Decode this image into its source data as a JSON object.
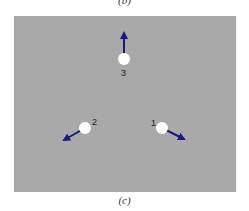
{
  "captions": {
    "top": "(b)",
    "bottom": "(c)"
  },
  "diagram": {
    "background_color": "#a9a9a9",
    "dot_color": "#ffffff",
    "arrow_color": "#1a1a7a",
    "points": [
      {
        "label": "1",
        "x": 162,
        "y": 128,
        "arrow_to": [
          184,
          139
        ]
      },
      {
        "label": "2",
        "x": 85,
        "y": 128,
        "arrow_to": [
          64,
          140
        ]
      },
      {
        "label": "3",
        "x": 124,
        "y": 59,
        "arrow_to": [
          124,
          33
        ]
      }
    ]
  }
}
